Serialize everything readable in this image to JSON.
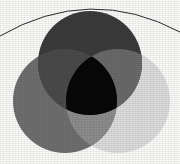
{
  "figure": {
    "kind": "venn-3-circle",
    "background_color": "#fbfbfa",
    "canvas": {
      "width": 180,
      "height": 164
    }
  },
  "arc": {
    "label": "decorative top arc",
    "stroke_color": "#2b2b2b",
    "stroke_width": 1,
    "start_x": 0,
    "start_y": 36,
    "control_x": 90,
    "control_y": -16,
    "end_x": 180,
    "end_y": 32
  },
  "circles": [
    {
      "id": "top",
      "label": "Top circle",
      "cx": 90,
      "cy": 63,
      "r": 52,
      "color": "#3b3b3b",
      "opacity": 1
    },
    {
      "id": "left",
      "label": "Lower-left circle",
      "cx": 65,
      "cy": 101,
      "r": 52,
      "color": "#6f6f6f",
      "opacity": 1
    },
    {
      "id": "right",
      "label": "Lower-right circle",
      "cx": 118,
      "cy": 101,
      "r": 52,
      "color": "#dddddd",
      "opacity": 1
    }
  ],
  "regions": [
    {
      "id": "top-only",
      "label": "Top only",
      "color": "#3b3b3b"
    },
    {
      "id": "left-only",
      "label": "Left only",
      "color": "#6f6f6f"
    },
    {
      "id": "right-only",
      "label": "Right only",
      "color": "#dddddd"
    },
    {
      "id": "top-left",
      "label": "Top and left overlap",
      "color": "#4a4a4a"
    },
    {
      "id": "top-right",
      "label": "Top and right overlap",
      "color": "#6a6a6a"
    },
    {
      "id": "left-right",
      "label": "Left and right overlap",
      "color": "#8d8d8d"
    },
    {
      "id": "center",
      "label": "All three overlap",
      "color": "#070707"
    }
  ],
  "caption": {
    "text": "·",
    "color": "#c9c9c6"
  }
}
